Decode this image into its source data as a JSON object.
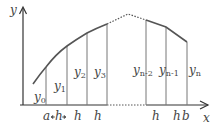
{
  "diagram": {
    "axes": {
      "x_label": "x",
      "y_label": "y"
    },
    "ordinates": [
      {
        "name": "y",
        "sub": "0"
      },
      {
        "name": "y",
        "sub": "1"
      },
      {
        "name": "y",
        "sub": "2"
      },
      {
        "name": "y",
        "sub": "3"
      },
      {
        "name": "y",
        "sub": "n-2"
      },
      {
        "name": "y",
        "sub": "n-1"
      },
      {
        "name": "y",
        "sub": "n"
      }
    ],
    "x_ticks": {
      "a": "a",
      "h": "h",
      "b": "b"
    },
    "colors": {
      "line": "#555555",
      "axis": "#333333",
      "curve": "#555555",
      "text": "#444444"
    }
  }
}
